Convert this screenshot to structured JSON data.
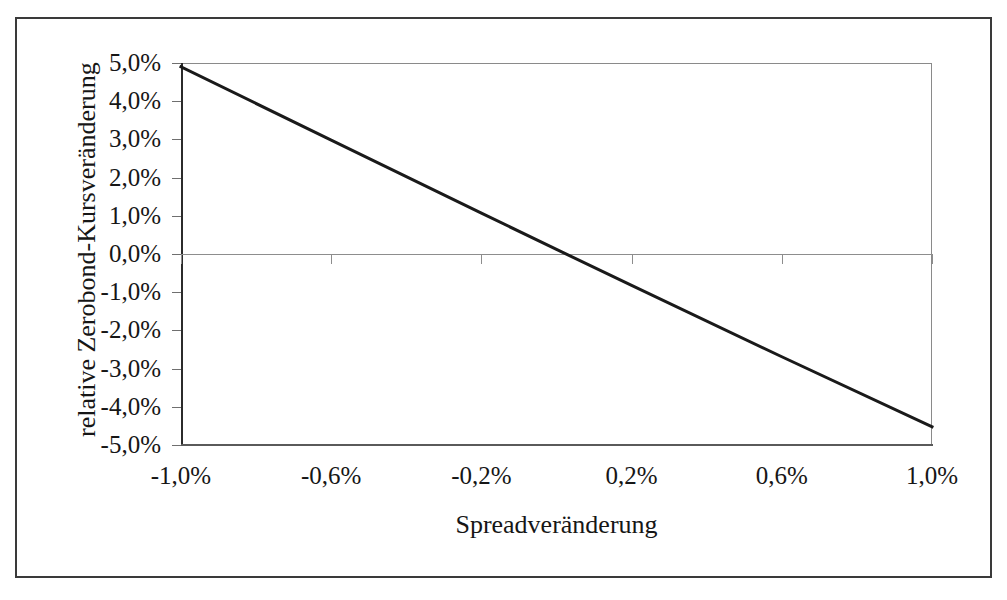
{
  "chart_data": {
    "type": "line",
    "title": "",
    "xlabel": "Spreadveränderung",
    "ylabel": "relative Zerobond-Kursveränderung",
    "x_tick_labels": [
      "-1,0%",
      "-0,6%",
      "-0,2%",
      "0,2%",
      "0,6%",
      "1,0%"
    ],
    "x_tick_values": [
      -1.0,
      -0.6,
      -0.2,
      0.2,
      0.6,
      1.0
    ],
    "y_tick_labels": [
      "5,0%",
      "4,0%",
      "3,0%",
      "2,0%",
      "1,0%",
      "0,0%",
      "-1,0%",
      "-2,0%",
      "-3,0%",
      "-4,0%",
      "-5,0%"
    ],
    "y_tick_values": [
      5.0,
      4.0,
      3.0,
      2.0,
      1.0,
      0.0,
      -1.0,
      -2.0,
      -3.0,
      -4.0,
      -5.0
    ],
    "xlim": [
      -1.0,
      1.0
    ],
    "ylim": [
      -5.0,
      5.0
    ],
    "grid": false,
    "zero_line": true,
    "legend": false,
    "series": [
      {
        "name": "relative Zerobond-Kursveränderung",
        "color": "#1a1a1a",
        "line_width": 3,
        "x": [
          -1.0,
          -0.6,
          -0.2,
          0.0,
          0.2,
          0.6,
          1.0
        ],
        "values": [
          4.9,
          2.98,
          1.07,
          0.12,
          -0.82,
          -2.69,
          -4.52
        ]
      }
    ],
    "annotations": []
  },
  "axis_titles": {
    "x": "Spreadveränderung",
    "y": "relative Zerobond-Kursveränderung"
  }
}
